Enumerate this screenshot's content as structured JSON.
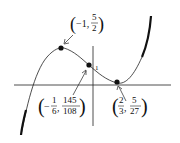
{
  "figure": {
    "type": "cubic-function-graph",
    "axes": {
      "x_axis": true,
      "y_axis": true,
      "y_tick_label": "1"
    },
    "curve_color": "#111111",
    "points": [
      {
        "name": "local-maximum",
        "x": "-1",
        "y": "5/2",
        "x_display": {
          "sign": "−",
          "num": "1",
          "den": ""
        },
        "y_display": {
          "num": "5",
          "den": "2"
        }
      },
      {
        "name": "inflection-point",
        "x": "-1/6",
        "y": "145/108",
        "x_display": {
          "sign": "−",
          "num": "1",
          "den": "6"
        },
        "y_display": {
          "num": "145",
          "den": "108"
        }
      },
      {
        "name": "local-minimum",
        "x": "2/3",
        "y": "5/27",
        "x_display": {
          "sign": "",
          "num": "2",
          "den": "3"
        },
        "y_display": {
          "num": "5",
          "den": "27"
        }
      }
    ]
  }
}
